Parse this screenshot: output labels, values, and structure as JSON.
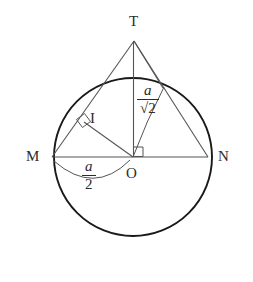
{
  "figure": {
    "type": "geometry-diagram",
    "colors": {
      "stroke_circle": "#1a1a1a",
      "stroke_line": "#555555",
      "stroke_arc": "#555555",
      "text": "#2b2b2b",
      "background": "#ffffff"
    },
    "labels": {
      "T": "T",
      "M": "M",
      "N": "N",
      "O": "O",
      "I": "I"
    },
    "measures": {
      "chord_half": {
        "numerator": "a",
        "denominator": "2"
      },
      "tangent_length": {
        "numerator": "a",
        "denominator": "√2",
        "denominator_radicand": "2",
        "radical_glyph": "√"
      }
    },
    "points": {
      "T": {
        "x": 134,
        "y": 41
      },
      "M": {
        "x": 52,
        "y": 157
      },
      "N": {
        "x": 208,
        "y": 157
      },
      "O": {
        "x": 133,
        "y": 157
      },
      "I": {
        "x": 84,
        "y": 122
      }
    },
    "circle": {
      "cx": 133,
      "cy": 157,
      "r": 79
    },
    "right_angles": [
      {
        "at": "I",
        "name": "right-angle-at-i"
      },
      {
        "at": "O",
        "name": "right-angle-at-o"
      }
    ]
  }
}
